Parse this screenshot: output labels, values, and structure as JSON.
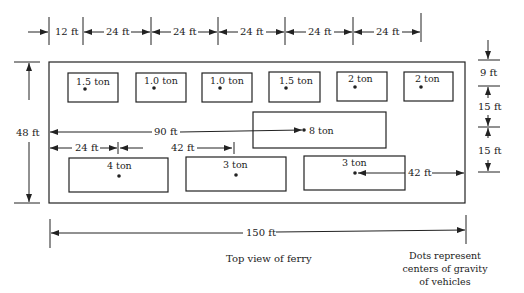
{
  "figure": {
    "caption": "Top view of ferry",
    "note_lines": [
      "Dots represent",
      "centers of gravity",
      "of vehicles"
    ]
  },
  "ferry": {
    "length": "150 ft",
    "width": "48 ft"
  },
  "top_dimensions": [
    "12 ft",
    "24 ft",
    "24 ft",
    "24 ft",
    "24 ft",
    "24 ft"
  ],
  "right_dimensions": [
    "9 ft",
    "15 ft",
    "15 ft"
  ],
  "interior_dimensions": {
    "to_8ton": "90 ft",
    "left_to_4ton": "24 ft",
    "4ton_to_3ton": "42 ft",
    "3ton_to_right": "42 ft"
  },
  "vehicles": [
    {
      "label": "1.5 ton"
    },
    {
      "label": "1.0 ton"
    },
    {
      "label": "1.0 ton"
    },
    {
      "label": "1.5 ton"
    },
    {
      "label": "2 ton"
    },
    {
      "label": "2 ton"
    },
    {
      "label": "8 ton"
    },
    {
      "label": "4 ton"
    },
    {
      "label": "3 ton"
    },
    {
      "label": "3 ton"
    }
  ]
}
